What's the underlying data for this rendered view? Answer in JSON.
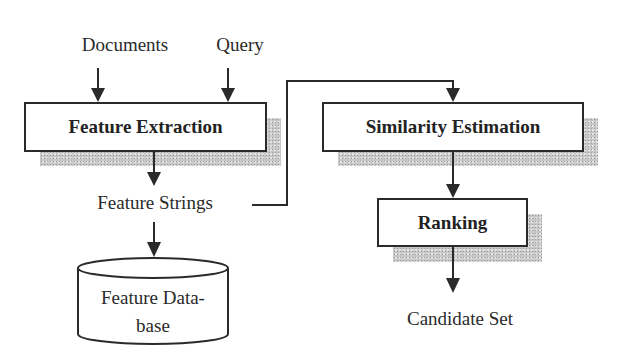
{
  "diagram": {
    "inputs": {
      "documents": "Documents",
      "query": "Query"
    },
    "nodes": {
      "feature_extraction": "Feature Extraction",
      "similarity_estimation": "Similarity Estimation",
      "ranking": "Ranking"
    },
    "intermediate": {
      "feature_strings": "Feature Strings"
    },
    "database": {
      "line1": "Feature Data-",
      "line2": "base"
    },
    "output": {
      "candidate_set": "Candidate Set"
    },
    "edges": [
      {
        "from": "Documents",
        "to": "Feature Extraction"
      },
      {
        "from": "Query",
        "to": "Feature Extraction"
      },
      {
        "from": "Feature Extraction",
        "to": "Feature Strings"
      },
      {
        "from": "Feature Strings",
        "to": "Feature Database"
      },
      {
        "from": "Feature Strings",
        "to": "Similarity Estimation"
      },
      {
        "from": "Similarity Estimation",
        "to": "Ranking"
      },
      {
        "from": "Ranking",
        "to": "Candidate Set"
      }
    ],
    "colors": {
      "stroke": "#2a2a2a",
      "shadow": "#c8c8c8",
      "background": "#ffffff"
    }
  }
}
